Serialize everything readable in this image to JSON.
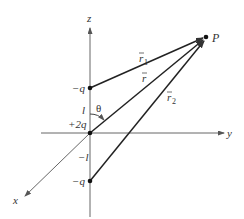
{
  "axes": {
    "z_label": "z",
    "y_label": "y",
    "x_label": "x"
  },
  "charges": {
    "top": {
      "label": "−q",
      "position": "z = l"
    },
    "center": {
      "label": "+2q",
      "position": "origin"
    },
    "bottom": {
      "label": "−q",
      "position": "z = −l"
    }
  },
  "distances": {
    "upper": "l",
    "lower": "−l"
  },
  "point": {
    "label": "P"
  },
  "vectors": {
    "r1": {
      "base": "r",
      "sub": "1"
    },
    "r": {
      "base": "r",
      "sub": ""
    },
    "r2": {
      "base": "r",
      "sub": "2"
    }
  },
  "angle": {
    "label": "θ"
  },
  "colors": {
    "axis": "#555555",
    "vector": "#222222",
    "text": "#333333"
  }
}
